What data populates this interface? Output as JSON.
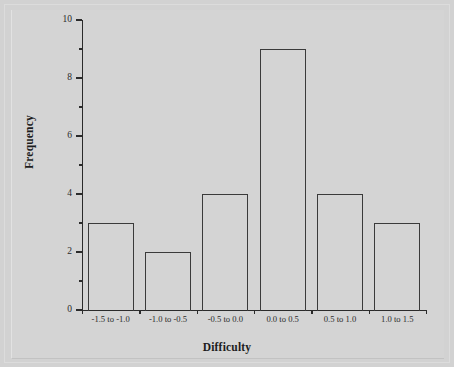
{
  "figure": {
    "background_color": "#d4d4d4",
    "frame_color": "#dcdcdc",
    "axis_color": "#2b2b2b",
    "bar_outline_color": "#3a3a3a",
    "bar_fill": "none"
  },
  "chart_data": {
    "type": "bar",
    "title": "",
    "subtitle": "",
    "xlabel": "Difficulty",
    "ylabel": "Frequency",
    "categories": [
      "-1.5 to -1.0",
      "-1.0 to -0.5",
      "-0.5 to 0.0",
      "0.0 to 0.5",
      "0.5 to 1.0",
      "1.0 to 1.5"
    ],
    "values": [
      3,
      2,
      4,
      9,
      4,
      3
    ],
    "ylim": [
      0,
      10
    ],
    "y_major_ticks": [
      0,
      2,
      4,
      6,
      8,
      10
    ],
    "y_major_tick_labels": [
      "0",
      "2",
      "4",
      "6",
      "8",
      "10"
    ],
    "y_minor_ticks": [
      1,
      3,
      5,
      7,
      9
    ],
    "grid": false,
    "legend": null,
    "legend_position": "none",
    "bar_style": "outline-only",
    "annotations": []
  }
}
